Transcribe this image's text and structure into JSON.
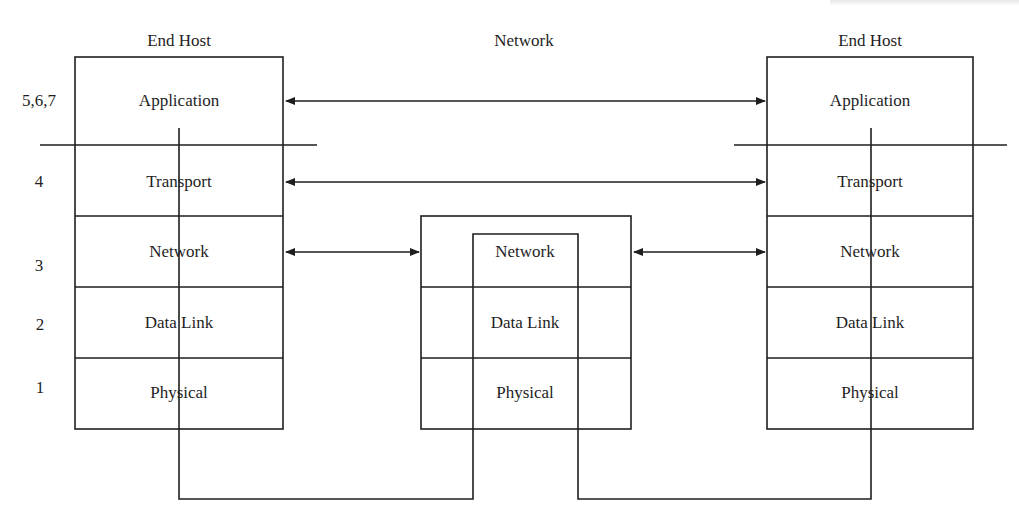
{
  "headers": {
    "left_host": "End Host",
    "network": "Network",
    "right_host": "End Host"
  },
  "layer_numbers": [
    {
      "label": "5,6,7",
      "y": 101
    },
    {
      "label": "4",
      "y": 182
    },
    {
      "label": "3",
      "y": 266
    },
    {
      "label": "2",
      "y": 325
    },
    {
      "label": "1",
      "y": 388
    }
  ],
  "left_host_layers": [
    "Application",
    "Transport",
    "Network",
    "Data Link",
    "Physical"
  ],
  "right_host_layers": [
    "Application",
    "Transport",
    "Network",
    "Data Link",
    "Physical"
  ],
  "router_layers": [
    "Network",
    "Data Link",
    "Physical"
  ],
  "connections": [
    {
      "from": "left.Application",
      "to": "right.Application",
      "type": "bidirectional"
    },
    {
      "from": "left.Transport",
      "to": "right.Transport",
      "type": "bidirectional"
    },
    {
      "from": "left.Network",
      "to": "router.Network",
      "type": "bidirectional"
    },
    {
      "from": "router.Network",
      "to": "right.Network",
      "type": "bidirectional"
    }
  ],
  "colors": {
    "line": "#1e1e1e",
    "background": "#ffffff"
  }
}
